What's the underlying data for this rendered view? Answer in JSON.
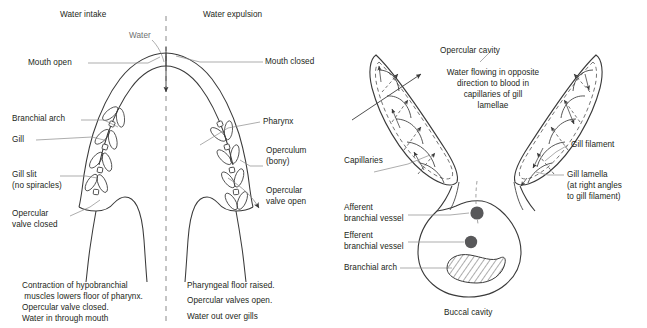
{
  "figure": {
    "title_left": "Water intake",
    "title_right": "Water expulsion",
    "colors": {
      "ink": "#231f20",
      "stroke": "#3a3a3a",
      "background": "#ffffff",
      "vessel_fill": "#58585a",
      "hatch": "#4a4a4a"
    }
  },
  "left_diagram": {
    "headers": {
      "intake": "Water intake",
      "expulsion": "Water expulsion"
    },
    "labels": {
      "water": "Water",
      "mouth_open": "Mouth open",
      "mouth_closed": "Mouth closed",
      "branchial_arch": "Branchial arch",
      "gill": "Gill",
      "gill_slit_line1": "Gill slit",
      "gill_slit_line2": "(no spiracles)",
      "opercular_valve_closed_line1": "Opercular",
      "opercular_valve_closed_line2": "valve closed",
      "pharynx": "Pharynx",
      "operculum_line1": "Operculum",
      "operculum_line2": "(bony)",
      "opercular_valve_open_line1": "Opercular",
      "opercular_valve_open_line2": "valve open"
    },
    "caption_left": [
      "Contraction of hypobranchial",
      " muscles lowers floor of pharynx.",
      "Opercular valve closed.",
      "Water in through mouth"
    ],
    "caption_right": [
      "Pharyngeal floor raised.",
      "Opercular valves open.",
      "Water out over gills"
    ]
  },
  "right_diagram": {
    "labels": {
      "opercular_cavity": "Opercular cavity",
      "flow_note": [
        "Water flowing in opposite",
        "direction to blood in",
        "capillaries of gill",
        "lamellae"
      ],
      "capillaries": "Capillaries",
      "gill_filament": "Gill filament",
      "gill_lamella_line1": "Gill lamella",
      "gill_lamella_line2": "(at right angles",
      "gill_lamella_line3": "to gill filament)",
      "afferent_line1": "Afferent",
      "afferent_line2": "branchial vessel",
      "efferent_line1": "Efferent",
      "efferent_line2": "branchial vessel",
      "branchial_arch": "Branchial arch",
      "buccal_cavity": "Buccal cavity"
    }
  }
}
